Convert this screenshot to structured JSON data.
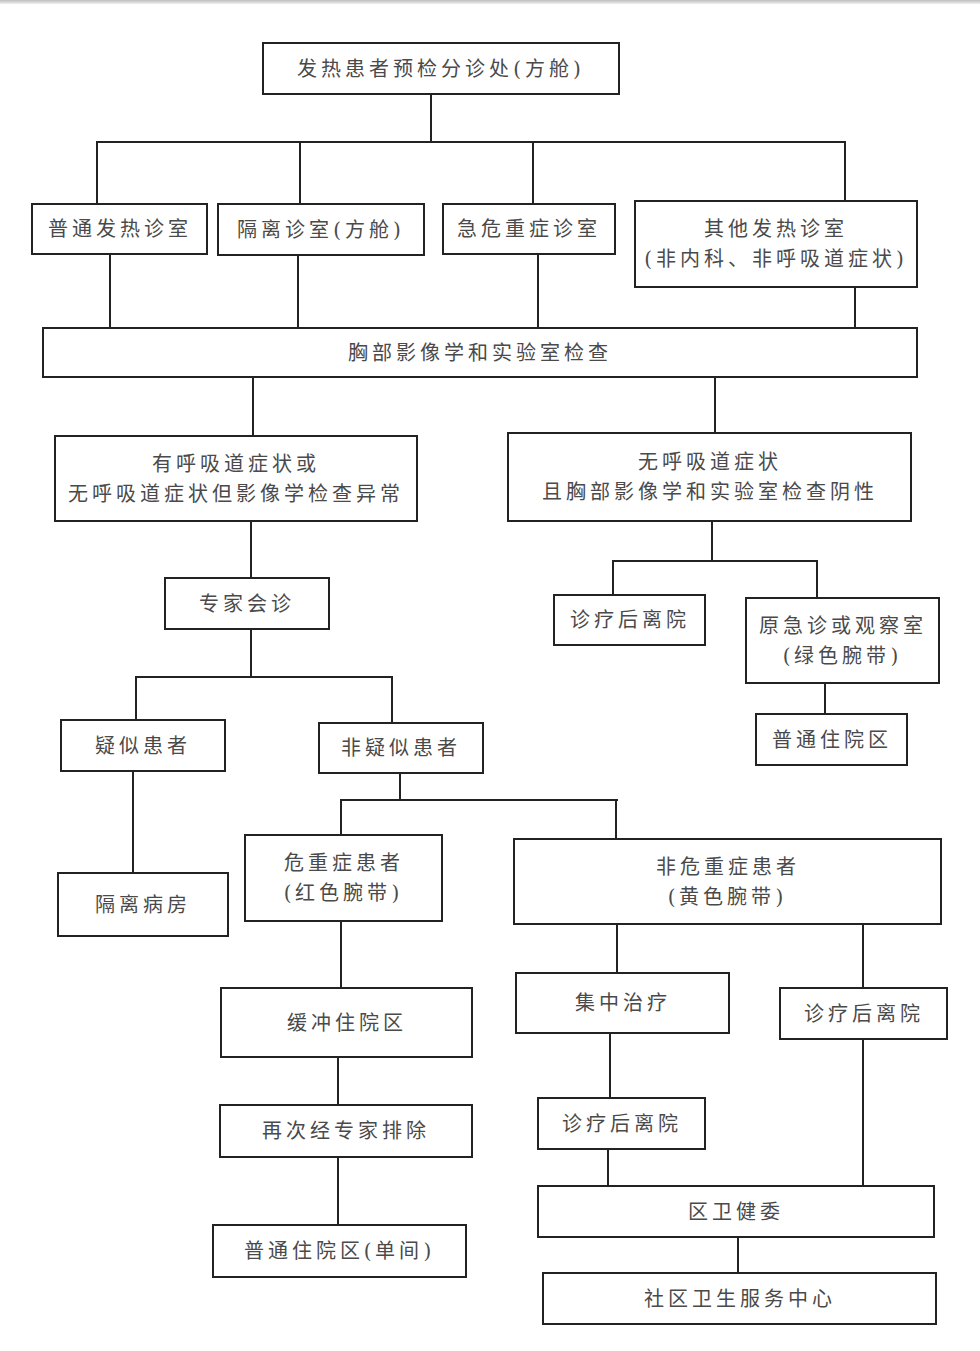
{
  "diagram": {
    "type": "flowchart",
    "nodes": {
      "triage": [
        "发热患者预检分诊处(方舱)"
      ],
      "general_fever_clinic": [
        "普通发热诊室"
      ],
      "isolation_clinic": [
        "隔离诊室(方舱)"
      ],
      "critical_clinic": [
        "急危重症诊室"
      ],
      "other_fever_clinic": [
        "其他发热诊室",
        "(非内科、非呼吸道症状)"
      ],
      "chest_imaging_lab": [
        "胸部影像学和实验室检查"
      ],
      "respiratory_or_abnormal": [
        "有呼吸道症状或",
        "无呼吸道症状但影像学检查异常"
      ],
      "no_respiratory_negative": [
        "无呼吸道症状",
        "且胸部影像学和实验室检查阴性"
      ],
      "expert_consultation": [
        "专家会诊"
      ],
      "discharge_after_treatment_1": [
        "诊疗后离院"
      ],
      "original_emergency_observation": [
        "原急诊或观察室",
        "(绿色腕带)"
      ],
      "general_ward_1": [
        "普通住院区"
      ],
      "suspected_patient": [
        "疑似患者"
      ],
      "non_suspected_patient": [
        "非疑似患者"
      ],
      "isolation_ward": [
        "隔离病房"
      ],
      "critical_patient": [
        "危重症患者",
        "(红色腕带)"
      ],
      "non_critical_patient": [
        "非危重症患者",
        "(黄色腕带)"
      ],
      "buffer_ward": [
        "缓冲住院区"
      ],
      "centralized_treatment": [
        "集中治疗"
      ],
      "discharge_after_treatment_2": [
        "诊疗后离院"
      ],
      "expert_exclusion_again": [
        "再次经专家排除"
      ],
      "discharge_after_treatment_3": [
        "诊疗后离院"
      ],
      "district_health_commission": [
        "区卫健委"
      ],
      "general_ward_single_room": [
        "普通住院区(单间)"
      ],
      "community_health_center": [
        "社区卫生服务中心"
      ]
    },
    "edges": [
      [
        "triage",
        "general_fever_clinic"
      ],
      [
        "triage",
        "isolation_clinic"
      ],
      [
        "triage",
        "critical_clinic"
      ],
      [
        "triage",
        "other_fever_clinic"
      ],
      [
        "general_fever_clinic",
        "chest_imaging_lab"
      ],
      [
        "isolation_clinic",
        "chest_imaging_lab"
      ],
      [
        "critical_clinic",
        "chest_imaging_lab"
      ],
      [
        "other_fever_clinic",
        "chest_imaging_lab"
      ],
      [
        "chest_imaging_lab",
        "respiratory_or_abnormal"
      ],
      [
        "chest_imaging_lab",
        "no_respiratory_negative"
      ],
      [
        "respiratory_or_abnormal",
        "expert_consultation"
      ],
      [
        "no_respiratory_negative",
        "discharge_after_treatment_1"
      ],
      [
        "no_respiratory_negative",
        "original_emergency_observation"
      ],
      [
        "original_emergency_observation",
        "general_ward_1"
      ],
      [
        "expert_consultation",
        "suspected_patient"
      ],
      [
        "expert_consultation",
        "non_suspected_patient"
      ],
      [
        "suspected_patient",
        "isolation_ward"
      ],
      [
        "non_suspected_patient",
        "critical_patient"
      ],
      [
        "non_suspected_patient",
        "non_critical_patient"
      ],
      [
        "critical_patient",
        "buffer_ward"
      ],
      [
        "buffer_ward",
        "expert_exclusion_again"
      ],
      [
        "expert_exclusion_again",
        "general_ward_single_room"
      ],
      [
        "non_critical_patient",
        "centralized_treatment"
      ],
      [
        "non_critical_patient",
        "discharge_after_treatment_2"
      ],
      [
        "centralized_treatment",
        "discharge_after_treatment_3"
      ],
      [
        "discharge_after_treatment_3",
        "district_health_commission"
      ],
      [
        "discharge_after_treatment_2",
        "district_health_commission"
      ],
      [
        "district_health_commission",
        "community_health_center"
      ]
    ]
  }
}
